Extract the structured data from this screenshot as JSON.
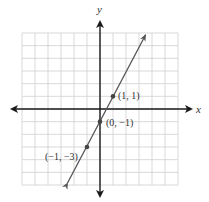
{
  "chart_data": {
    "type": "line",
    "title": "",
    "xlabel": "x",
    "ylabel": "y",
    "xlim": [
      -6,
      6
    ],
    "ylim": [
      -6,
      6
    ],
    "grid": true,
    "series": [
      {
        "name": "y = 2x - 1",
        "slope": 2,
        "intercept": -1,
        "x": [
          -2.5,
          3.5
        ],
        "y": [
          -6,
          6
        ]
      }
    ],
    "points": [
      {
        "x": 1,
        "y": 1,
        "label": "(1, 1)"
      },
      {
        "x": 0,
        "y": -1,
        "label": "(0, −1)"
      },
      {
        "x": -1,
        "y": -3,
        "label": "(−1, −3)"
      }
    ],
    "colors": {
      "grid": "#cfcfcf",
      "axis": "#1a1a1a",
      "line": "#555555",
      "point": "#444444"
    }
  },
  "labels": {
    "x_axis": "x",
    "y_axis": "y",
    "p1": "(1, 1)",
    "p2": "(0, −1)",
    "p3": "(−1, −3)"
  }
}
